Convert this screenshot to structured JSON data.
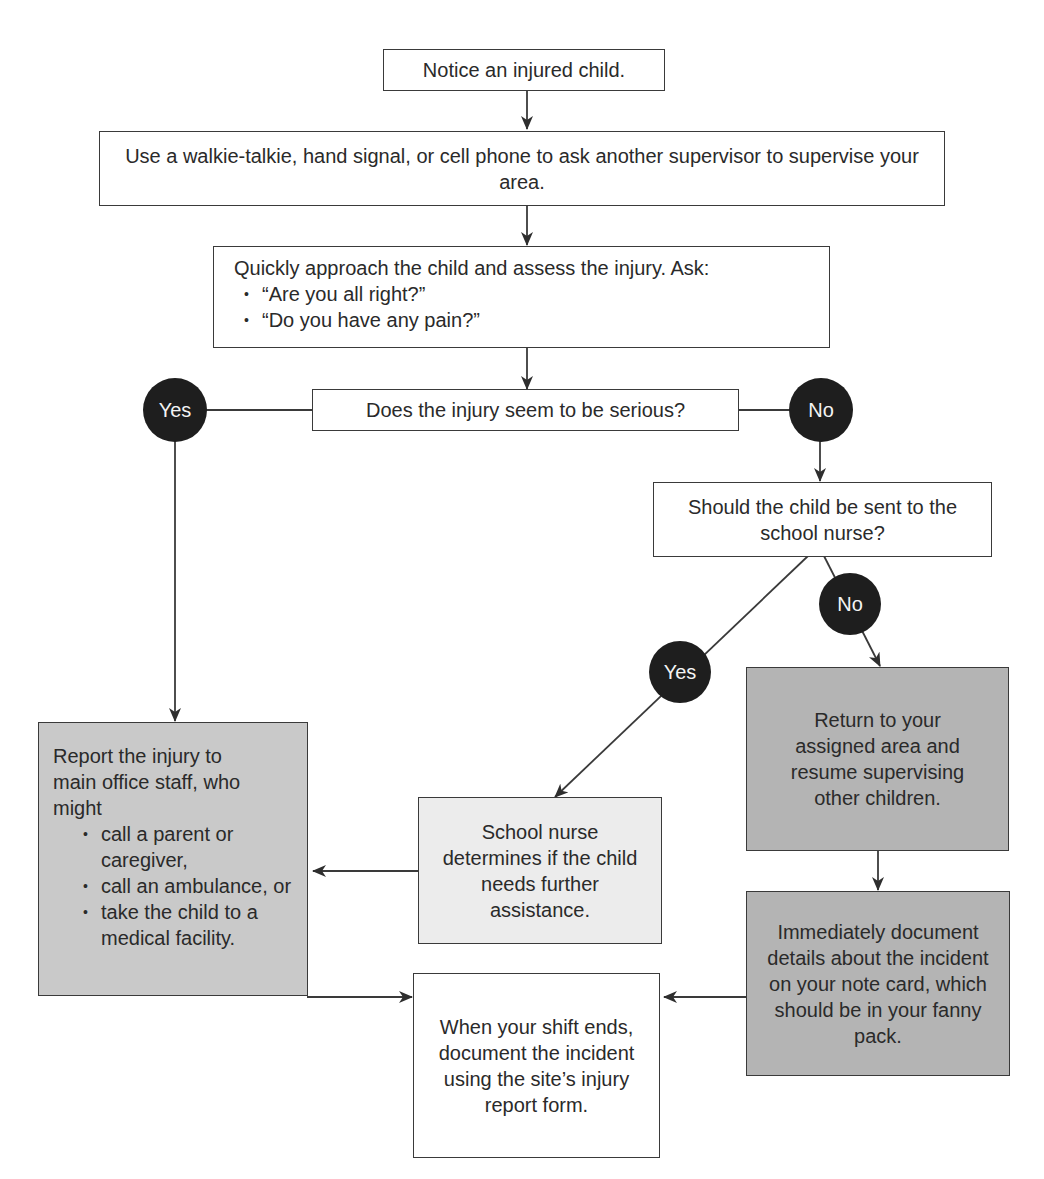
{
  "flowchart": {
    "start": "Notice an injured child.",
    "ask_supervisor": "Use a walkie-talkie, hand signal, or cell phone to ask another supervisor to supervise your area.",
    "assess": {
      "text": "Quickly approach the child and assess the injury.  Ask:",
      "questions": [
        "“Are you all right?”",
        "“Do you have any pain?”"
      ]
    },
    "decision_serious": "Does the injury seem to be serious?",
    "decision_nurse": "Should the child be sent to the school nurse?",
    "labels": {
      "yes": "Yes",
      "no": "No"
    },
    "report": {
      "text": "Report the injury to main office staff, who might",
      "options": [
        "call a parent or caregiver,",
        "call an ambulance, or",
        "take the child to a medical facility."
      ]
    },
    "nurse": "School nurse determines if the child needs further assistance.",
    "return": "Return to your assigned area and resume supervising other children.",
    "document_now": "Immediately document details about the incident on your note card, which should be in your fanny pack.",
    "document_shift": "When your shift ends, document the incident using the site’s injury report form."
  }
}
